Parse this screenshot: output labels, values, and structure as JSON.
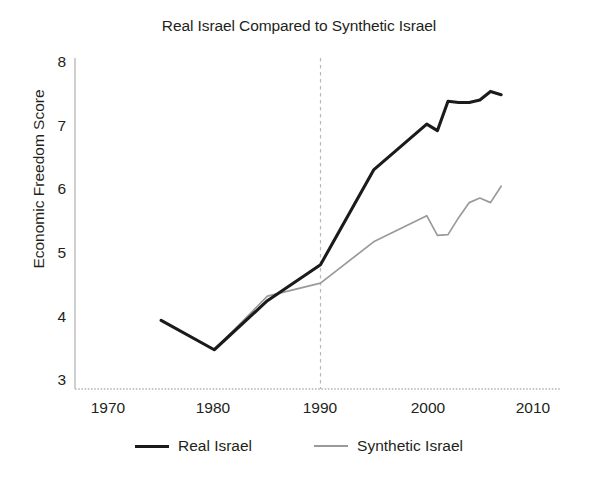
{
  "chart_data": {
    "type": "line",
    "title": "Real Israel Compared to Synthetic Israel",
    "xlabel": "",
    "ylabel": "Economic Freedom Score",
    "xlim": [
      1965,
      2012
    ],
    "ylim": [
      3,
      8
    ],
    "xticks": [
      1970,
      1980,
      1990,
      2000,
      2010
    ],
    "yticks": [
      3,
      4,
      5,
      6,
      7,
      8
    ],
    "grid": false,
    "legend_position": "bottom",
    "annotations": [
      {
        "type": "vertical-line",
        "x": 1990,
        "style": "dashed",
        "color": "#b9b9b9",
        "label": "intervention-year"
      }
    ],
    "x": [
      1975,
      1980,
      1985,
      1990,
      1995,
      2000,
      2001,
      2002,
      2003,
      2004,
      2005,
      2006,
      2007
    ],
    "series": [
      {
        "name": "Real Israel",
        "color": "#1b1b1b",
        "style": "solid",
        "values": [
          4.05,
          3.6,
          4.35,
          4.9,
          6.35,
          7.05,
          6.95,
          7.4,
          7.38,
          7.38,
          7.42,
          7.55,
          7.5
        ]
      },
      {
        "name": "Synthetic Israel",
        "color": "#9a9a9a",
        "style": "solid-thin",
        "values": [
          4.05,
          3.6,
          4.42,
          4.62,
          5.25,
          5.65,
          5.35,
          5.36,
          5.62,
          5.85,
          5.92,
          5.85,
          6.1
        ]
      }
    ]
  },
  "legend": {
    "entries": [
      {
        "label": "Real Israel",
        "key": "real"
      },
      {
        "label": "Synthetic Israel",
        "key": "synth"
      }
    ]
  },
  "axes": {
    "y_tick_labels": [
      "8",
      "7",
      "6",
      "5",
      "4",
      "3"
    ],
    "x_tick_labels": [
      "1970",
      "1980",
      "1990",
      "2000",
      "2010"
    ]
  }
}
